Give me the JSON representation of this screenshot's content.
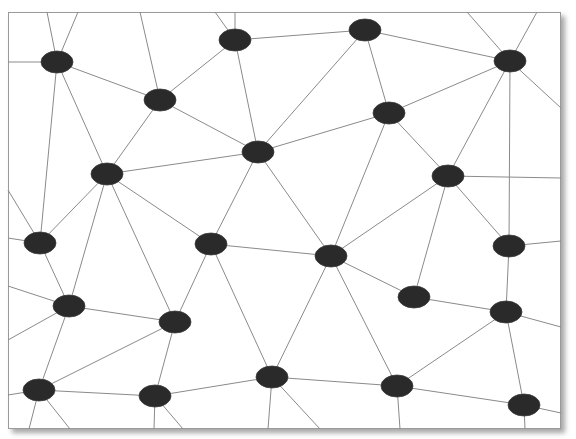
{
  "diagram": {
    "type": "network-graph",
    "frame": {
      "x": 8,
      "y": 12,
      "width": 553,
      "height": 417,
      "background": "#ffffff",
      "border_color": "#9a9a9a"
    },
    "style": {
      "node_color": "#2a2a2a",
      "edge_color": "#8a8a8a",
      "node_rx": 16,
      "node_ry": 11
    },
    "nodes": [
      {
        "id": "n1",
        "x": 57,
        "y": 62
      },
      {
        "id": "n2",
        "x": 235,
        "y": 40
      },
      {
        "id": "n3",
        "x": 365,
        "y": 30
      },
      {
        "id": "n4",
        "x": 510,
        "y": 61
      },
      {
        "id": "n5",
        "x": 160,
        "y": 100
      },
      {
        "id": "n6",
        "x": 389,
        "y": 113
      },
      {
        "id": "n7",
        "x": 258,
        "y": 152
      },
      {
        "id": "n8",
        "x": 107,
        "y": 174
      },
      {
        "id": "n9",
        "x": 448,
        "y": 176
      },
      {
        "id": "n10",
        "x": 40,
        "y": 243
      },
      {
        "id": "n11",
        "x": 211,
        "y": 244
      },
      {
        "id": "n12",
        "x": 331,
        "y": 256
      },
      {
        "id": "n13",
        "x": 509,
        "y": 246
      },
      {
        "id": "n14",
        "x": 69,
        "y": 306
      },
      {
        "id": "n15",
        "x": 414,
        "y": 297
      },
      {
        "id": "n16",
        "x": 175,
        "y": 322
      },
      {
        "id": "n17",
        "x": 506,
        "y": 312
      },
      {
        "id": "n18",
        "x": 39,
        "y": 390
      },
      {
        "id": "n19",
        "x": 155,
        "y": 396
      },
      {
        "id": "n20",
        "x": 272,
        "y": 377
      },
      {
        "id": "n21",
        "x": 397,
        "y": 386
      },
      {
        "id": "n22",
        "x": 524,
        "y": 405
      }
    ],
    "edges": [
      [
        "n1",
        "n5"
      ],
      [
        "n1",
        "n8"
      ],
      [
        "n1",
        "n10"
      ],
      [
        "n5",
        "n2"
      ],
      [
        "n5",
        "n8"
      ],
      [
        "n5",
        "n7"
      ],
      [
        "n2",
        "n3"
      ],
      [
        "n2",
        "n7"
      ],
      [
        "n3",
        "n4"
      ],
      [
        "n3",
        "n6"
      ],
      [
        "n3",
        "n7"
      ],
      [
        "n4",
        "n6"
      ],
      [
        "n4",
        "n9"
      ],
      [
        "n4",
        "n13"
      ],
      [
        "n6",
        "n7"
      ],
      [
        "n6",
        "n9"
      ],
      [
        "n6",
        "n12"
      ],
      [
        "n7",
        "n8"
      ],
      [
        "n7",
        "n11"
      ],
      [
        "n7",
        "n12"
      ],
      [
        "n8",
        "n10"
      ],
      [
        "n8",
        "n11"
      ],
      [
        "n8",
        "n14"
      ],
      [
        "n8",
        "n16"
      ],
      [
        "n9",
        "n12"
      ],
      [
        "n9",
        "n15"
      ],
      [
        "n9",
        "n13"
      ],
      [
        "n10",
        "n14"
      ],
      [
        "n11",
        "n12"
      ],
      [
        "n11",
        "n16"
      ],
      [
        "n11",
        "n20"
      ],
      [
        "n12",
        "n15"
      ],
      [
        "n12",
        "n20"
      ],
      [
        "n12",
        "n21"
      ],
      [
        "n13",
        "n17"
      ],
      [
        "n14",
        "n16"
      ],
      [
        "n14",
        "n18"
      ],
      [
        "n15",
        "n17"
      ],
      [
        "n16",
        "n18"
      ],
      [
        "n16",
        "n19"
      ],
      [
        "n17",
        "n21"
      ],
      [
        "n17",
        "n22"
      ],
      [
        "n18",
        "n19"
      ],
      [
        "n19",
        "n20"
      ],
      [
        "n20",
        "n21"
      ],
      [
        "n21",
        "n22"
      ]
    ],
    "border_edges": [
      {
        "from": "n1",
        "to": [
          8,
          62
        ]
      },
      {
        "from": "n1",
        "to": [
          47,
          12
        ]
      },
      {
        "from": "n1",
        "to": [
          78,
          12
        ]
      },
      {
        "from": "n5",
        "to": [
          140,
          12
        ]
      },
      {
        "from": "n2",
        "to": [
          215,
          12
        ]
      },
      {
        "from": "n2",
        "to": [
          235,
          12
        ]
      },
      {
        "from": "n4",
        "to": [
          467,
          12
        ]
      },
      {
        "from": "n4",
        "to": [
          537,
          12
        ]
      },
      {
        "from": "n4",
        "to": [
          561,
          108
        ]
      },
      {
        "from": "n9",
        "to": [
          561,
          178
        ]
      },
      {
        "from": "n13",
        "to": [
          561,
          241
        ]
      },
      {
        "from": "n17",
        "to": [
          561,
          327
        ]
      },
      {
        "from": "n22",
        "to": [
          561,
          413
        ]
      },
      {
        "from": "n10",
        "to": [
          8,
          238
        ]
      },
      {
        "from": "n10",
        "to": [
          8,
          190
        ]
      },
      {
        "from": "n14",
        "to": [
          8,
          286
        ]
      },
      {
        "from": "n14",
        "to": [
          8,
          340
        ]
      },
      {
        "from": "n18",
        "to": [
          8,
          395
        ]
      },
      {
        "from": "n18",
        "to": [
          29,
          429
        ]
      },
      {
        "from": "n18",
        "to": [
          70,
          429
        ]
      },
      {
        "from": "n19",
        "to": [
          154,
          429
        ]
      },
      {
        "from": "n19",
        "to": [
          183,
          429
        ]
      },
      {
        "from": "n20",
        "to": [
          268,
          429
        ]
      },
      {
        "from": "n20",
        "to": [
          320,
          429
        ]
      },
      {
        "from": "n21",
        "to": [
          400,
          429
        ]
      },
      {
        "from": "n22",
        "to": [
          525,
          429
        ]
      }
    ]
  }
}
